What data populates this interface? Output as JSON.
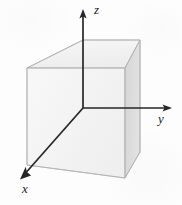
{
  "figure": {
    "background_color": "#fdfdfd",
    "axes": {
      "origin": {
        "x": 83,
        "y": 108
      },
      "items": [
        {
          "name": "z",
          "label": "z",
          "direction": "up",
          "line": {
            "x1": 83,
            "y1": 108,
            "x2": 83,
            "y2": 14
          },
          "arrow_tip": {
            "x": 83,
            "y": 10
          },
          "label_pos": {
            "x": 94,
            "y": 3
          },
          "color": "#262626"
        },
        {
          "name": "y",
          "label": "y",
          "direction": "right",
          "line": {
            "x1": 83,
            "y1": 108,
            "x2": 166,
            "y2": 108
          },
          "arrow_tip": {
            "x": 171,
            "y": 108
          },
          "label_pos": {
            "x": 158,
            "y": 112
          },
          "color": "#262626"
        },
        {
          "name": "x",
          "label": "x",
          "direction": "down-left",
          "line": {
            "x1": 83,
            "y1": 108,
            "x2": 27,
            "y2": 172
          },
          "arrow_tip": {
            "x": 22,
            "y": 178
          },
          "label_pos": {
            "x": 22,
            "y": 182
          },
          "color": "#262626"
        }
      ]
    },
    "box": {
      "description": "Shaded rectangular box (cube) drawn in the first octant region behind the axes",
      "edge_color": "#b9b9b9",
      "faces": [
        {
          "name": "top-face",
          "fill": "#f2f2f2",
          "points": "27,68 83,40 140,40 125,68"
        },
        {
          "name": "front-left-face",
          "fill": "#f6f6f6",
          "points": "27,68 125,68 125,178 27,165"
        },
        {
          "name": "right-face",
          "fill": "#dcdcdc",
          "points": "125,68 140,40 140,152 125,178"
        }
      ],
      "vertices": {
        "top_front_left": {
          "x": 27,
          "y": 68
        },
        "top_back_left": {
          "x": 83,
          "y": 40
        },
        "top_back_right": {
          "x": 140,
          "y": 40
        },
        "top_front_right": {
          "x": 125,
          "y": 68
        },
        "bottom_front_left": {
          "x": 27,
          "y": 165
        },
        "bottom_front_right": {
          "x": 125,
          "y": 178
        },
        "bottom_back_right": {
          "x": 140,
          "y": 152
        }
      }
    }
  }
}
